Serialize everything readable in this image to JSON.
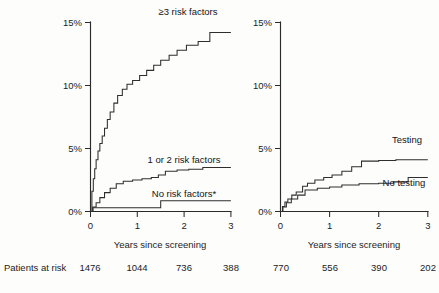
{
  "figure": {
    "background_color": "#fdfdfc",
    "ink_color": "#2e2e2e"
  },
  "panels": [
    {
      "id": "left",
      "x_axis": {
        "label": "Years since screening",
        "ticks": [
          "0",
          "1",
          "2",
          "3"
        ],
        "min": 0,
        "max": 3
      },
      "y_axis": {
        "ticks": [
          "0%",
          "5%",
          "10%",
          "15%"
        ],
        "min": 0,
        "max": 15
      },
      "curve_labels": {
        "high": "≥3 risk factors",
        "mid": "1 or 2 risk factors",
        "low": "No risk factors*"
      }
    },
    {
      "id": "right",
      "x_axis": {
        "label": "Years since screening",
        "ticks": [
          "0",
          "1",
          "2",
          "3"
        ],
        "min": 0,
        "max": 3
      },
      "y_axis": {
        "ticks": [
          "0%",
          "5%",
          "10%",
          "15%"
        ],
        "min": 0,
        "max": 15
      },
      "curve_labels": {
        "testing": "Testing",
        "no_testing": "No testing"
      }
    }
  ],
  "risk_table": {
    "caption": "Patients at risk",
    "left_counts": [
      "1476",
      "1044",
      "736",
      "388"
    ],
    "right_counts": [
      "770",
      "556",
      "390",
      "202"
    ]
  },
  "chart_data": {
    "type": "line",
    "title": "",
    "xlabel": "Years since screening",
    "ylabel": "",
    "xlim": [
      0,
      3
    ],
    "ylim": [
      0,
      15
    ],
    "grid": false,
    "legend": "inline-labels",
    "panels": [
      {
        "name": "By risk factor count",
        "series": [
          {
            "name": "≥3 risk factors",
            "x": [
              0,
              0.03,
              0.06,
              0.09,
              0.12,
              0.16,
              0.2,
              0.25,
              0.3,
              0.36,
              0.42,
              0.5,
              0.58,
              0.68,
              0.78,
              0.9,
              1.05,
              1.2,
              1.35,
              1.5,
              1.68,
              1.85,
              2.05,
              2.3,
              2.55,
              3.0
            ],
            "y": [
              0,
              1.6,
              2.6,
              3.4,
              4.1,
              4.8,
              5.4,
              6.0,
              6.6,
              7.3,
              7.9,
              8.6,
              9.2,
              9.7,
              10.1,
              10.4,
              10.8,
              11.2,
              11.6,
              12.0,
              12.4,
              12.8,
              13.2,
              13.5,
              14.2,
              14.2
            ]
          },
          {
            "name": "1 or 2 risk factors",
            "x": [
              0,
              0.05,
              0.12,
              0.2,
              0.3,
              0.42,
              0.55,
              0.7,
              0.9,
              1.1,
              1.3,
              1.45,
              1.6,
              1.85,
              2.1,
              2.4,
              3.0
            ],
            "y": [
              0,
              0.35,
              0.7,
              1.1,
              1.5,
              1.85,
              2.2,
              2.4,
              2.5,
              2.6,
              2.7,
              2.9,
              3.2,
              3.3,
              3.35,
              3.5,
              3.5
            ]
          },
          {
            "name": "No risk factors*",
            "x": [
              0,
              0.05,
              1.5,
              3.0
            ],
            "y": [
              0,
              0.3,
              0.85,
              0.85
            ]
          }
        ]
      },
      {
        "name": "By testing status",
        "series": [
          {
            "name": "Testing",
            "x": [
              0,
              0.04,
              0.09,
              0.15,
              0.23,
              0.32,
              0.45,
              0.55,
              0.7,
              0.88,
              1.05,
              1.25,
              1.45,
              1.65,
              2.0,
              2.35,
              3.0
            ],
            "y": [
              0,
              0.4,
              0.75,
              1.0,
              1.3,
              1.55,
              2.0,
              2.25,
              2.5,
              2.7,
              2.9,
              3.2,
              3.55,
              4.0,
              4.05,
              4.1,
              4.1
            ]
          },
          {
            "name": "No testing",
            "x": [
              0,
              0.05,
              0.12,
              0.22,
              0.35,
              0.5,
              0.75,
              1.0,
              1.25,
              1.6,
              2.0,
              2.3,
              2.6,
              3.0
            ],
            "y": [
              0,
              0.35,
              0.7,
              1.0,
              1.3,
              1.7,
              1.85,
              1.95,
              2.1,
              2.2,
              2.25,
              2.35,
              2.7,
              2.7
            ]
          }
        ]
      }
    ]
  }
}
